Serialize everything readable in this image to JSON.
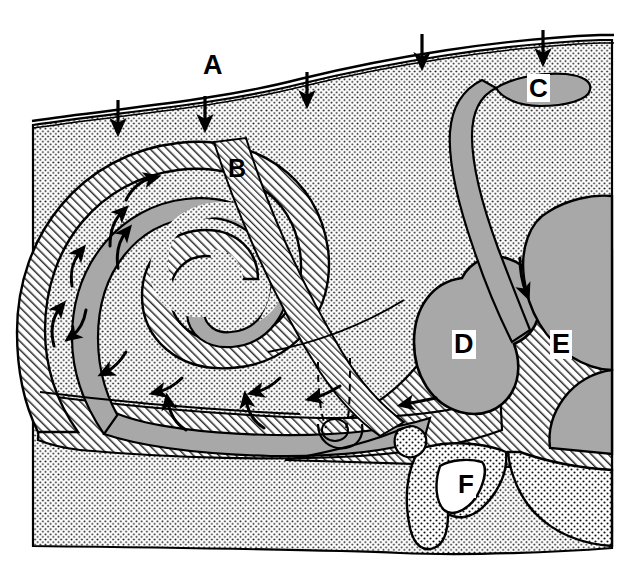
{
  "figure": {
    "background_color": "#ffffff",
    "width": 618,
    "height": 578
  },
  "palette": {
    "ink": "#000000",
    "paper": "#ffffff",
    "duct_gray": "#a8a8a8",
    "vestibule_gray": "#a8a8a8",
    "stipple_dot": "#1a1a1a",
    "hatch_line": "#2a2a2a"
  },
  "labels": [
    {
      "id": "A",
      "text": "A",
      "style": "plain",
      "x": 203,
      "y": 52,
      "refers_to": "space above outer surface membrane"
    },
    {
      "id": "B",
      "text": "B",
      "style": "plain",
      "x": 228,
      "y": 156,
      "refers_to": "narrow hatched canal running diagonally downward"
    },
    {
      "id": "C",
      "text": "C",
      "style": "chip",
      "x": 527,
      "y": 74,
      "refers_to": "flattened gray sac at upper right beneath surface"
    },
    {
      "id": "D",
      "text": "D",
      "style": "chip",
      "x": 452,
      "y": 330,
      "refers_to": "gray kidney-shaped chamber"
    },
    {
      "id": "E",
      "text": "E",
      "style": "chip",
      "x": 550,
      "y": 330,
      "refers_to": "large gray region at right edge"
    },
    {
      "id": "F",
      "text": "F",
      "style": "chip",
      "x": 456,
      "y": 470,
      "refers_to": "white triangular opening in stippled projection"
    }
  ],
  "surface_arrows": {
    "count": 5,
    "direction": "down",
    "description": "solid black arrows pointing down onto the outer surface",
    "positions": [
      {
        "x": 118,
        "y": 110
      },
      {
        "x": 205,
        "y": 106
      },
      {
        "x": 307,
        "y": 82
      },
      {
        "x": 422,
        "y": 52
      },
      {
        "x": 543,
        "y": 44
      }
    ]
  },
  "flow_arrows": {
    "count": 13,
    "description": "curved black flow arrows tracing fluid movement around the spiral and into the chambers",
    "items": [
      {
        "x": 144,
        "y": 186,
        "angle": -35,
        "note": "outer turn upper"
      },
      {
        "x": 117,
        "y": 222,
        "angle": -70,
        "note": "outer turn left-upper"
      },
      {
        "x": 125,
        "y": 243,
        "angle": -65,
        "note": "inner turn left"
      },
      {
        "x": 78,
        "y": 258,
        "angle": -70,
        "note": "outer wall left"
      },
      {
        "x": 57,
        "y": 321,
        "angle": -75,
        "note": "outer wall lower left"
      },
      {
        "x": 77,
        "y": 320,
        "angle": -105,
        "note": "return flow lower left"
      },
      {
        "x": 114,
        "y": 365,
        "angle": -95,
        "note": "gray duct return"
      },
      {
        "x": 168,
        "y": 387,
        "angle": -115,
        "note": "gray duct return mid"
      },
      {
        "x": 170,
        "y": 414,
        "angle": -80,
        "note": "lower channel up"
      },
      {
        "x": 248,
        "y": 412,
        "angle": -80,
        "note": "lower channel up right"
      },
      {
        "x": 263,
        "y": 384,
        "angle": -115,
        "note": "gray duct return right"
      },
      {
        "x": 323,
        "y": 394,
        "angle": -105,
        "note": "toward helicotrema"
      },
      {
        "x": 411,
        "y": 405,
        "angle": -170,
        "note": "into vestibule from duct"
      }
    ]
  },
  "anatomy_notes": {
    "spiral": "cochlear spiral, two and a half turns, gray duct inside hatched bone",
    "stipple_region": "fine dot stipple representing surrounding soft tissue / bone marrow",
    "hatch_region": "diagonal line hatch representing dense bone",
    "dashed_outline": "dashed line marking hidden canal near the base of the spiral"
  }
}
